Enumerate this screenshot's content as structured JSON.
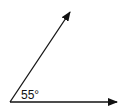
{
  "diagram": {
    "type": "angle",
    "angle_label": "55°",
    "angle_degrees": 55,
    "vertex": [
      10,
      102
    ],
    "rays": [
      {
        "name": "horizontal-ray",
        "end": [
          119,
          102
        ]
      },
      {
        "name": "inclined-ray",
        "end": [
          71,
          10
        ]
      }
    ],
    "colors": {
      "line": "#111111",
      "background": "#ffffff"
    }
  }
}
